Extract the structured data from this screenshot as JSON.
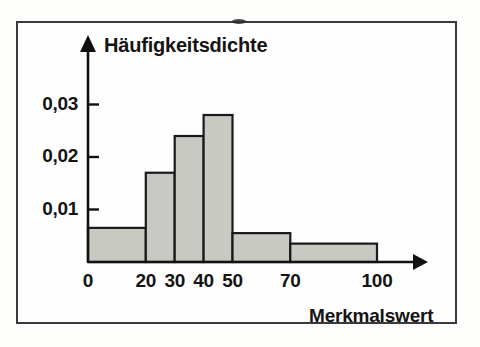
{
  "figure": {
    "background_color": "#fefefe",
    "frame_color": "#3a3a3a",
    "bar_fill_color": "#c9c9c4",
    "bar_edge_color": "#1a1a1a",
    "axis_color": "#111111"
  },
  "chart_data": {
    "type": "bar",
    "title": "",
    "subtitle": "",
    "xlabel": "Merkmalswert",
    "ylabel": "Häufigkeitsdichte",
    "grid": false,
    "legend": null,
    "xlim": [
      0,
      112
    ],
    "ylim": [
      0,
      0.0335
    ],
    "xticks": [
      0,
      20,
      30,
      40,
      50,
      70,
      100
    ],
    "xtick_labels": [
      "0",
      "20",
      "30",
      "40",
      "50",
      "70",
      "100"
    ],
    "yticks": [
      0.01,
      0.02,
      0.03
    ],
    "ytick_labels": [
      "0,01",
      "0,02",
      "0,03"
    ],
    "bins": [
      {
        "label": "0-20",
        "start": 0,
        "end": 20,
        "value": 0.0065
      },
      {
        "label": "20-30",
        "start": 20,
        "end": 30,
        "value": 0.017
      },
      {
        "label": "30-40",
        "start": 30,
        "end": 40,
        "value": 0.024
      },
      {
        "label": "40-50",
        "start": 40,
        "end": 50,
        "value": 0.028
      },
      {
        "label": "50-70",
        "start": 50,
        "end": 70,
        "value": 0.0055
      },
      {
        "label": "70-100",
        "start": 70,
        "end": 100,
        "value": 0.0035
      }
    ],
    "categories": [
      "0-20",
      "20-30",
      "30-40",
      "40-50",
      "50-70",
      "70-100"
    ],
    "values": [
      0.0065,
      0.017,
      0.024,
      0.028,
      0.0055,
      0.0035
    ]
  }
}
